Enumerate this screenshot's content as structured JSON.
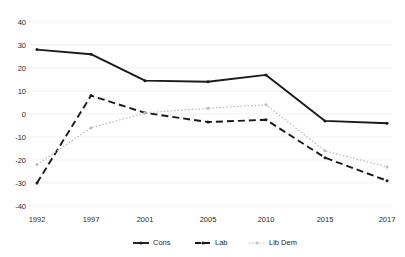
{
  "chart_data": {
    "type": "line",
    "title": "",
    "xlabel": "",
    "ylabel": "",
    "categories": [
      "1992",
      "1997",
      "2001",
      "2005",
      "2010",
      "2015",
      "2017"
    ],
    "ylim": [
      -40,
      40
    ],
    "yticks": [
      "40",
      "30",
      "20",
      "10",
      "0",
      "-10",
      "-20",
      "-30",
      "-40"
    ],
    "ytick_values": [
      40,
      30,
      20,
      10,
      0,
      -10,
      -20,
      -30,
      -40
    ],
    "grid": true,
    "legend_position": "bottom",
    "series": [
      {
        "name": "Cons",
        "color": "#1a1a1a",
        "style": "solid",
        "values": [
          28,
          26,
          14.5,
          14,
          17,
          -3,
          -4
        ]
      },
      {
        "name": "Lab",
        "color": "#1a1a1a",
        "style": "dashed",
        "values": [
          -30,
          8,
          0.5,
          -3.5,
          -2.5,
          -19,
          -29
        ]
      },
      {
        "name": "Lib Dem",
        "color": "#bdbdbd",
        "style": "dotted",
        "values": [
          -22,
          -6,
          0.5,
          2.5,
          4,
          -16,
          -23
        ]
      }
    ]
  }
}
